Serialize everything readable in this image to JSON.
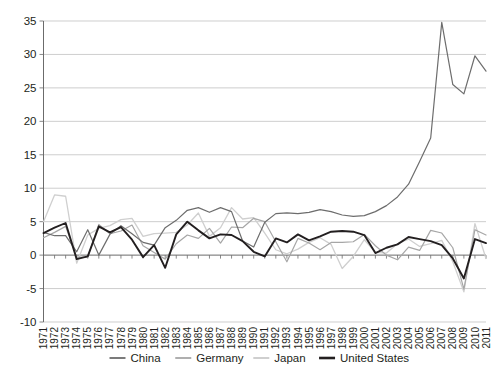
{
  "chart_data": {
    "type": "line",
    "title": "",
    "subtitle": "",
    "xlabel": "",
    "ylabel": "",
    "ylim": [
      -10,
      35
    ],
    "yticks": [
      -10,
      -5,
      0,
      5,
      10,
      15,
      20,
      25,
      30,
      35
    ],
    "ytick_labels": [
      "-10",
      "-5",
      "0",
      "5",
      "10",
      "15",
      "20",
      "25",
      "30",
      "35"
    ],
    "grid": true,
    "legend_position": "bottom",
    "x": [
      1971,
      1972,
      1973,
      1974,
      1975,
      1976,
      1977,
      1978,
      1979,
      1980,
      1981,
      1982,
      1983,
      1984,
      1985,
      1986,
      1987,
      1988,
      1989,
      1990,
      1991,
      1992,
      1993,
      1994,
      1995,
      1996,
      1997,
      1998,
      1999,
      2000,
      2001,
      2002,
      2003,
      2004,
      2005,
      2006,
      2007,
      2008,
      2009,
      2010,
      2011
    ],
    "xtick_labels": [
      "1971",
      "1972",
      "1973",
      "1974",
      "1975",
      "1976",
      "1977",
      "1978",
      "1979",
      "1980",
      "1981",
      "1982",
      "1983",
      "1984",
      "1985",
      "1986",
      "1987",
      "1988",
      "1989",
      "1990",
      "1991",
      "1992",
      "1993",
      "1994",
      "1995",
      "1996",
      "1997",
      "1998",
      "1999",
      "2000",
      "2001",
      "2002",
      "2003",
      "2004",
      "2005",
      "2006",
      "2007",
      "2008",
      "2009",
      "2010",
      "2011"
    ],
    "series": [
      {
        "name": "China",
        "color": "#6d6d6d",
        "width": 1.2,
        "values": [
          3.4,
          2.9,
          2.9,
          0.5,
          3.8,
          0.0,
          3.1,
          4.4,
          3.2,
          1.9,
          1.5,
          4.1,
          5.2,
          6.7,
          7.1,
          6.4,
          7.1,
          6.5,
          2.1,
          1.2,
          4.9,
          6.2,
          6.3,
          6.2,
          6.4,
          6.8,
          6.5,
          6.0,
          5.8,
          5.9,
          6.5,
          7.4,
          8.7,
          10.6,
          14.0,
          17.5,
          34.8,
          25.5,
          24.1,
          29.8,
          27.5
        ]
      },
      {
        "name": "Germany",
        "color": "#a6a6a6",
        "width": 1.2,
        "values": [
          2.6,
          3.4,
          4.3,
          -0.3,
          -0.3,
          4.6,
          3.2,
          3.6,
          4.5,
          1.4,
          0.4,
          -0.6,
          1.7,
          3.0,
          2.5,
          4.0,
          1.8,
          4.2,
          4.1,
          5.5,
          5.0,
          2.0,
          -1.0,
          2.5,
          1.8,
          0.8,
          1.9,
          1.9,
          2.0,
          3.1,
          1.4,
          0.0,
          -0.7,
          1.2,
          0.7,
          3.7,
          3.3,
          1.1,
          -5.1,
          3.8,
          3.0
        ]
      },
      {
        "name": "Japan",
        "color": "#cfcfcf",
        "width": 1.3,
        "values": [
          5.0,
          9.0,
          8.8,
          -1.2,
          3.0,
          4.0,
          4.4,
          5.3,
          5.5,
          2.8,
          3.2,
          3.3,
          3.4,
          4.5,
          6.3,
          2.8,
          4.1,
          7.1,
          5.4,
          5.6,
          3.3,
          0.8,
          0.2,
          0.9,
          1.9,
          2.6,
          1.6,
          -2.0,
          -0.2,
          2.3,
          0.4,
          0.3,
          1.7,
          2.4,
          1.3,
          1.7,
          2.2,
          -1.0,
          -5.5,
          4.7,
          -0.5
        ]
      },
      {
        "name": "United States",
        "color": "#231f20",
        "width": 1.9,
        "values": [
          3.3,
          4.1,
          4.8,
          -0.6,
          -0.2,
          4.3,
          3.4,
          4.2,
          2.3,
          -0.3,
          1.5,
          -1.9,
          3.1,
          5.0,
          3.7,
          2.5,
          3.1,
          3.0,
          2.1,
          0.5,
          -0.2,
          2.5,
          1.9,
          3.1,
          2.2,
          2.8,
          3.5,
          3.6,
          3.5,
          3.0,
          0.3,
          1.1,
          1.6,
          2.7,
          2.4,
          2.1,
          1.5,
          -0.5,
          -3.5,
          2.4,
          1.8
        ]
      }
    ]
  },
  "legend": {
    "items": [
      {
        "label": "China",
        "color": "#6d6d6d",
        "width": 1.8
      },
      {
        "label": "Germany",
        "color": "#a6a6a6",
        "width": 1.8
      },
      {
        "label": "Japan",
        "color": "#cfcfcf",
        "width": 2.0
      },
      {
        "label": "United States",
        "color": "#231f20",
        "width": 2.6
      }
    ]
  },
  "colors": {
    "background": "#ffffff",
    "grid": "#b9b9b9",
    "axis": "#6b6b6b",
    "text": "#231f20"
  }
}
